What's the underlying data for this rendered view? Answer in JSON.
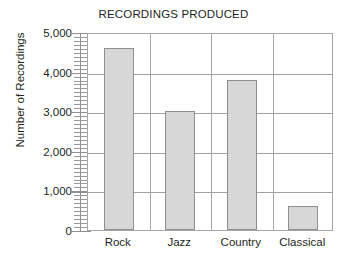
{
  "chart_data": {
    "type": "bar",
    "title": "RECORDINGS PRODUCED",
    "xlabel": "",
    "ylabel": "Number of Recordings",
    "categories": [
      "Rock",
      "Jazz",
      "Country",
      "Classical"
    ],
    "values": [
      4600,
      3000,
      3800,
      600
    ],
    "ylim": [
      0,
      5000
    ],
    "ytick_labels": [
      "0",
      "1,000",
      "2,000",
      "3,000",
      "4,000",
      "5,000"
    ],
    "ytick_values": [
      0,
      1000,
      2000,
      3000,
      4000,
      5000
    ],
    "minor_tick_step": 100,
    "grid": true,
    "legend": false,
    "colors": {
      "bar_fill": "#d7d7d7",
      "bar_border": "#8f8f8f",
      "gridline": "#a0a0a0",
      "frame": "#a6a6a6",
      "text": "#231f20",
      "background": "#ffffff"
    }
  }
}
